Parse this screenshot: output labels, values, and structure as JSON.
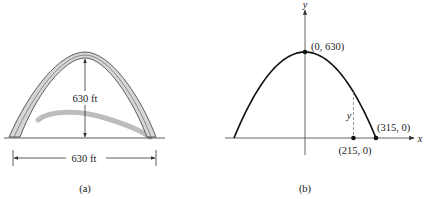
{
  "panel_a": {
    "caption": "(a)",
    "height_label": "630 ft",
    "width_label": "630 ft",
    "colors": {
      "arch_fill": "#d6d6d6",
      "arch_stroke": "#3a3a3a",
      "shadow": "#bdbdbd"
    }
  },
  "panel_b": {
    "caption": "(b)",
    "x_axis_label": "x",
    "y_axis_label": "y",
    "y_marker_label": "y",
    "points": [
      {
        "label": "(0, 630)",
        "x": 0,
        "y": 630
      },
      {
        "label": "(315, 0)",
        "x": 315,
        "y": 0
      },
      {
        "label": "(215, 0)",
        "x": 215,
        "y": 0
      }
    ],
    "curve": {
      "type": "parabola",
      "vertex": [
        0,
        630
      ],
      "x_intercepts": [
        -315,
        315
      ]
    },
    "dashed_at_x": 215
  }
}
